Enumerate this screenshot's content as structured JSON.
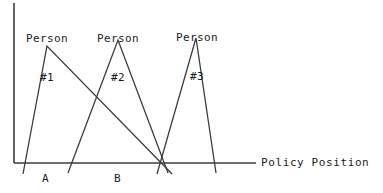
{
  "figure": {
    "background_color": "#ffffff",
    "line_color": "#3c3c3c",
    "text_color": "#1a1a1a",
    "axis_title": "Policy Position",
    "tick_labels": [
      "A",
      "B"
    ],
    "peak_labels": [
      {
        "line1": "Person",
        "line2": "#1"
      },
      {
        "line1": "Person",
        "line2": "#2"
      },
      {
        "line1": "Person",
        "line2": "#3"
      }
    ]
  },
  "chart_data": {
    "type": "line",
    "title": "",
    "subtitle": "",
    "xlabel": "Policy Position",
    "ylabel": "",
    "grid": false,
    "legend_position": "inline-above-peaks",
    "axis": {
      "y_axis_x_px": 14,
      "y_axis_top_px": 3,
      "x_axis_y_px": 163,
      "x_axis_left_px": 14,
      "x_axis_right_px": 256
    },
    "xlim": [
      0,
      1
    ],
    "ylim": [
      0,
      1
    ],
    "annotations": [
      {
        "text": "A",
        "x_px": 46,
        "y_px": 180
      },
      {
        "text": "B",
        "x_px": 118,
        "y_px": 180
      },
      {
        "text": "Policy Position",
        "x_px": 262,
        "y_px": 163
      }
    ],
    "series": [
      {
        "name": "Person #1",
        "peak_label": "Person\n#1",
        "peak": {
          "x_px": 47,
          "y_px": 46
        },
        "points_px": [
          {
            "x": 23,
            "y": 174
          },
          {
            "x": 47,
            "y": 46
          },
          {
            "x": 172,
            "y": 174
          }
        ],
        "ideal_point_label": "A"
      },
      {
        "name": "Person #2",
        "peak_label": "Person\n#2",
        "peak": {
          "x_px": 118,
          "y_px": 40
        },
        "points_px": [
          {
            "x": 68,
            "y": 173
          },
          {
            "x": 118,
            "y": 40
          },
          {
            "x": 168,
            "y": 173
          }
        ],
        "ideal_point_label": "B"
      },
      {
        "name": "Person #3",
        "peak_label": "Person\n#3",
        "peak": {
          "x_px": 196,
          "y_px": 38
        },
        "points_px": [
          {
            "x": 157,
            "y": 174
          },
          {
            "x": 196,
            "y": 38
          },
          {
            "x": 216,
            "y": 173
          }
        ],
        "ideal_point_label": ""
      }
    ]
  }
}
